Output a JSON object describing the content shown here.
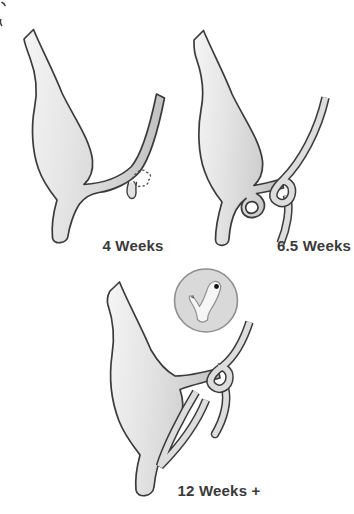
{
  "figure": {
    "stages": [
      {
        "id": "4-weeks",
        "label": "4 Weeks"
      },
      {
        "id": "6-5-weeks",
        "label": "6.5 Weeks"
      },
      {
        "id": "12-weeks-plus",
        "label": "12 Weeks +"
      }
    ],
    "inset": {
      "content": "magnified duct detail with papilla dot"
    }
  },
  "colors": {
    "background": "#ffffff",
    "shape_fill_light": "#f5f5f5",
    "shape_fill_dark": "#c3c3c3",
    "outline": "#3b3b3b",
    "tube_fill": "#dddddd",
    "inset_circle_fill": "#d9d9d9",
    "inset_circle_outline": "#8f8f8f",
    "inset_shape_fill": "#f6f6f6",
    "papilla_dot": "#141414",
    "label_text": "#3a3a3a"
  }
}
